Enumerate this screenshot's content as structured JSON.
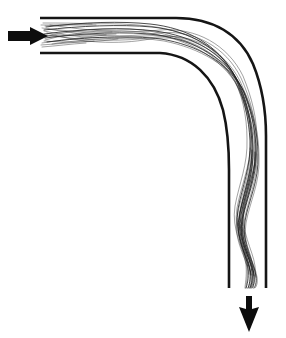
{
  "figure": {
    "background_color": "#ffffff",
    "line_color": "#151515",
    "fiber_color": "#1a1a1a",
    "arrow_color": "#0d0d0d",
    "width": 286,
    "height": 338
  },
  "elements": {
    "inlet_arrow": {
      "name": "inlet-direction-arrow",
      "direction": "right",
      "x": 8,
      "y": 36,
      "length": 40,
      "head_width": 18
    },
    "outlet_arrow": {
      "name": "outlet-direction-arrow",
      "direction": "down",
      "x": 249,
      "y": 296,
      "length": 36,
      "head_width": 20
    },
    "outer_wall": {
      "name": "channel-outer-wall",
      "description": "Outer wall of the 90 degree bend, horizontal inlet at top turning to vertical outlet at right"
    },
    "inner_wall": {
      "name": "channel-inner-wall",
      "description": "Inner wall of the 90 degree bend"
    },
    "fiber_bundle": {
      "name": "fiber-bundle",
      "strand_count": 14,
      "description": "Braided multifilament tow compressed against the outer wall through the bend and buckling into an S-shaped wave in the vertical outlet section"
    }
  }
}
